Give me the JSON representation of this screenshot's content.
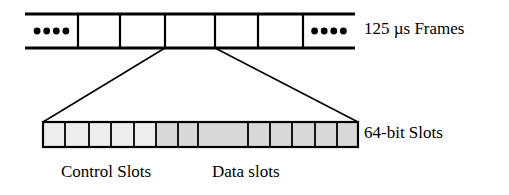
{
  "figure": {
    "background_color": "#ffffff",
    "line_color": "#000000"
  },
  "frame_row": {
    "name": "125 us frame train",
    "label": "125 µs Frames",
    "x": 25,
    "y": 14,
    "width": 330,
    "height": 34,
    "rail_thickness": 3,
    "divider_thickness": 2.2,
    "open_ends": true,
    "cells": [
      {
        "id": "frame-ellipsis-left",
        "kind": "ellipsis",
        "dots": 4,
        "x": 25,
        "width": 53
      },
      {
        "id": "frame-cell-1",
        "kind": "empty",
        "dots": 0,
        "x": 78,
        "width": 42
      },
      {
        "id": "frame-cell-2",
        "kind": "empty",
        "dots": 0,
        "x": 120,
        "width": 45
      },
      {
        "id": "frame-cell-3",
        "kind": "expanded",
        "dots": 0,
        "x": 165,
        "width": 50
      },
      {
        "id": "frame-cell-4",
        "kind": "empty",
        "dots": 0,
        "x": 215,
        "width": 43
      },
      {
        "id": "frame-cell-5",
        "kind": "empty",
        "dots": 0,
        "x": 258,
        "width": 45
      },
      {
        "id": "frame-ellipsis-right",
        "kind": "ellipsis",
        "dots": 4,
        "x": 303,
        "width": 52
      }
    ]
  },
  "expansion": {
    "name": "zoom guide lines",
    "from_left_x": 165,
    "from_right_x": 215,
    "from_y": 48,
    "to_left_x": 43,
    "to_right_x": 358,
    "to_y": 122,
    "thickness": 1.6
  },
  "slot_row": {
    "name": "64-bit slot strip",
    "label": "64-bit Slots",
    "x": 43,
    "y": 122,
    "width": 315,
    "height": 25,
    "border_thickness": 2.2,
    "divider_thickness": 1.8,
    "colors": {
      "control_fill": "#ededed",
      "data_fill": "#d8d8d8",
      "stroke": "#000000"
    },
    "slots": [
      {
        "id": "slot-1",
        "group": "control",
        "x": 43,
        "width": 22,
        "fill": "#ededed"
      },
      {
        "id": "slot-2",
        "group": "control",
        "x": 65,
        "width": 24,
        "fill": "#ededed"
      },
      {
        "id": "slot-3",
        "group": "control",
        "x": 89,
        "width": 22,
        "fill": "#ededed"
      },
      {
        "id": "slot-4",
        "group": "control",
        "x": 111,
        "width": 23,
        "fill": "#ededed"
      },
      {
        "id": "slot-5",
        "group": "control",
        "x": 134,
        "width": 22,
        "fill": "#ededed"
      },
      {
        "id": "slot-6",
        "group": "data",
        "x": 156,
        "width": 22,
        "fill": "#d8d8d8"
      },
      {
        "id": "slot-7",
        "group": "data",
        "x": 178,
        "width": 20,
        "fill": "#d8d8d8"
      },
      {
        "id": "slot-8",
        "group": "data",
        "x": 198,
        "width": 50,
        "fill": "#d8d8d8"
      },
      {
        "id": "slot-9",
        "group": "data",
        "x": 248,
        "width": 22,
        "fill": "#d8d8d8"
      },
      {
        "id": "slot-10",
        "group": "data",
        "x": 270,
        "width": 22,
        "fill": "#d8d8d8"
      },
      {
        "id": "slot-11",
        "group": "data",
        "x": 292,
        "width": 23,
        "fill": "#d8d8d8"
      },
      {
        "id": "slot-12",
        "group": "data",
        "x": 315,
        "width": 22,
        "fill": "#d8d8d8"
      },
      {
        "id": "slot-13",
        "group": "data",
        "x": 337,
        "width": 21,
        "fill": "#d8d8d8"
      }
    ]
  },
  "captions": {
    "control": "Control Slots",
    "data": "Data slots"
  }
}
